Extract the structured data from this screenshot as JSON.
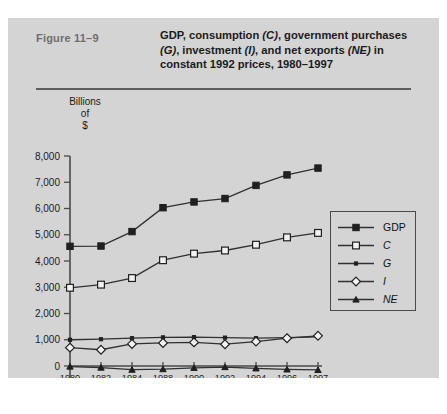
{
  "figure": {
    "number_label": "Figure  11–9",
    "title_line1_a": "GDP, consumption ",
    "title_line1_b": "(C)",
    "title_line1_c": ", government purchases",
    "title_line2_a": "(G)",
    "title_line2_b": ", investment ",
    "title_line2_c": "(I)",
    "title_line2_d": ", and net exports ",
    "title_line2_e": "(NE)",
    "title_line2_f": " in",
    "title_line3": "constant 1992 prices, 1980–1997"
  },
  "axis": {
    "y_caption_line1": "Billions",
    "y_caption_line2": "of",
    "y_caption_line3": "$"
  },
  "colors": {
    "card_background": "#d4d4d4",
    "page_background": "#ffffff",
    "axis": "#4a4a4a",
    "series": "#303030",
    "title_text": "#1b1b1b",
    "figure_number_text": "#6e6e6e",
    "marker_open_fill": "#f2f2f2"
  },
  "chart_data": {
    "type": "line",
    "title": "GDP, consumption (C), government purchases (G), investment (I), and net exports (NE) in constant 1992 prices, 1980–1997",
    "xlabel": "",
    "ylabel": "Billions of $",
    "categories": [
      "1980",
      "1982",
      "1984",
      "1988",
      "1990",
      "1992",
      "1994",
      "1996",
      "1997"
    ],
    "ytick_labels": [
      "8,000",
      "7,000",
      "6,000",
      "5,000",
      "4,000",
      "3,000",
      "2,000",
      "1,000",
      "0",
      "–1,000"
    ],
    "ytick_values": [
      8000,
      7000,
      6000,
      5000,
      4000,
      3000,
      2000,
      1000,
      0,
      -1000
    ],
    "ylim": [
      -1000,
      8000
    ],
    "grid": false,
    "legend_position": "right-inside",
    "series": [
      {
        "name": "GDP",
        "marker": "filled-square",
        "values": [
          4560,
          4570,
          5120,
          6030,
          6250,
          6380,
          6880,
          7280,
          7540
        ]
      },
      {
        "name": "C",
        "marker": "open-square",
        "values": [
          2980,
          3100,
          3350,
          4030,
          4280,
          4400,
          4620,
          4900,
          5070
        ]
      },
      {
        "name": "G",
        "marker": "small-dot",
        "values": [
          1000,
          1020,
          1060,
          1090,
          1100,
          1080,
          1060,
          1080,
          1110
        ]
      },
      {
        "name": "I",
        "marker": "open-diamond",
        "values": [
          700,
          620,
          840,
          880,
          900,
          830,
          930,
          1060,
          1150
        ]
      },
      {
        "name": "NE",
        "marker": "filled-triangle",
        "values": [
          -20,
          -60,
          -140,
          -120,
          -70,
          -40,
          -90,
          -130,
          -150
        ]
      }
    ]
  },
  "legend": {
    "items": [
      {
        "label": "GDP",
        "italic": false
      },
      {
        "label": "C",
        "italic": true
      },
      {
        "label": "G",
        "italic": true
      },
      {
        "label": "I",
        "italic": true
      },
      {
        "label": "NE",
        "italic": true
      }
    ]
  }
}
